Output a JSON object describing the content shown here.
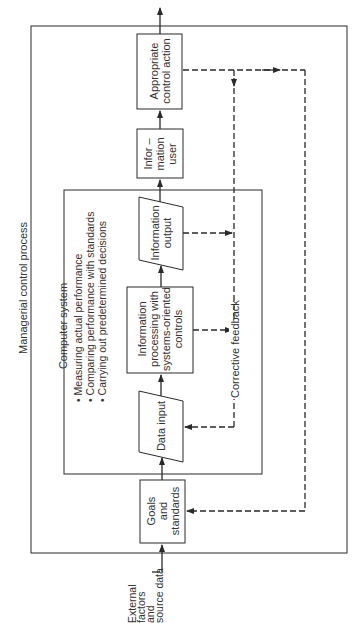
{
  "diagram": {
    "outer_label": "Managerial control process",
    "computer_system": {
      "title": "Computer system",
      "bullets": [
        "Measuring actual performance",
        "Comparing performance with standards",
        "Carrying out predetermined decisions"
      ]
    },
    "input_label": [
      "External",
      "factors",
      "and",
      "source",
      "data"
    ],
    "nodes": {
      "goals": [
        "Goals",
        "and",
        "standards"
      ],
      "data_input": [
        "Data input"
      ],
      "processing": [
        "Information",
        "processing with",
        "systems-oriented",
        "controls"
      ],
      "output": [
        "Information",
        "output"
      ],
      "user": [
        "Infor –",
        "mation",
        "user"
      ],
      "action": [
        "Appropriate",
        "control action"
      ]
    },
    "feedback_label": "Corrective feedback",
    "colors": {
      "line": "#2a2a2a",
      "background": "#ffffff"
    }
  }
}
